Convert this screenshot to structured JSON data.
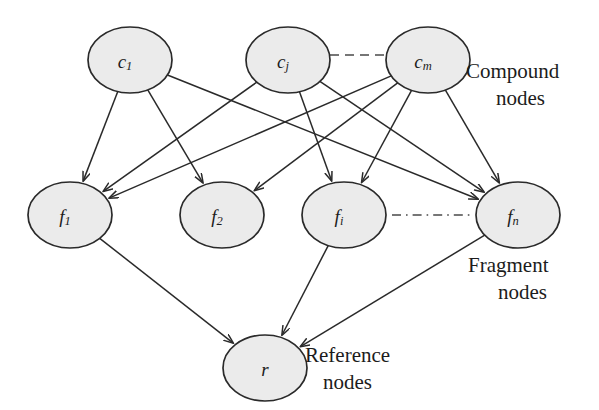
{
  "diagram": {
    "background_color": "#ffffff",
    "node_fill_color": "#ebebeb",
    "node_stroke_color": "#2a2a2a",
    "edge_color": "#2a2a2a",
    "text_color": "#1c1c1c",
    "layers": [
      {
        "id": "compound",
        "label_line1": "Compound",
        "label_line2": "nodes",
        "nodes": [
          {
            "id": "c1",
            "base": "c",
            "sub": "1",
            "cx": 130,
            "cy": 60
          },
          {
            "id": "cj",
            "base": "c",
            "sub": "j",
            "cx": 288,
            "cy": 60
          },
          {
            "id": "cm",
            "base": "c",
            "sub": "m",
            "cx": 428,
            "cy": 60
          }
        ],
        "separator": {
          "style": "dashed",
          "from_x": 330,
          "to_x": 386,
          "y": 55
        }
      },
      {
        "id": "fragment",
        "label_line1": "Fragment",
        "label_line2": "nodes",
        "nodes": [
          {
            "id": "f1",
            "base": "f",
            "sub": "1",
            "cx": 70,
            "cy": 215
          },
          {
            "id": "f2",
            "base": "f",
            "sub": "2",
            "cx": 222,
            "cy": 215
          },
          {
            "id": "fi",
            "base": "f",
            "sub": "i",
            "cx": 344,
            "cy": 215
          },
          {
            "id": "fn",
            "base": "f",
            "sub": "n",
            "cx": 518,
            "cy": 215
          }
        ],
        "separator": {
          "style": "dash-dot",
          "from_x": 392,
          "to_x": 470,
          "y": 215
        }
      },
      {
        "id": "reference",
        "label_line1": "Reference",
        "label_line2": "nodes",
        "nodes": [
          {
            "id": "r",
            "base": "r",
            "sub": "",
            "cx": 265,
            "cy": 368
          }
        ],
        "separator": null
      }
    ],
    "edges": [
      {
        "from": "c1",
        "to": "f1"
      },
      {
        "from": "c1",
        "to": "f2"
      },
      {
        "from": "c1",
        "to": "fn"
      },
      {
        "from": "cj",
        "to": "f1"
      },
      {
        "from": "cj",
        "to": "fi"
      },
      {
        "from": "cj",
        "to": "fn"
      },
      {
        "from": "cm",
        "to": "f1"
      },
      {
        "from": "cm",
        "to": "f2"
      },
      {
        "from": "cm",
        "to": "fi"
      },
      {
        "from": "cm",
        "to": "fn"
      },
      {
        "from": "f1",
        "to": "r"
      },
      {
        "from": "fi",
        "to": "r"
      },
      {
        "from": "fn",
        "to": "r"
      }
    ],
    "group_labels": {
      "compound": {
        "line1": "Compound",
        "line2": "nodes",
        "x": 466,
        "y": 78
      },
      "fragment": {
        "line1": "Fragment",
        "line2": "nodes",
        "x": 468,
        "y": 272
      },
      "reference": {
        "line1": "Reference",
        "line2": "nodes",
        "x": 305,
        "y": 362
      }
    }
  }
}
